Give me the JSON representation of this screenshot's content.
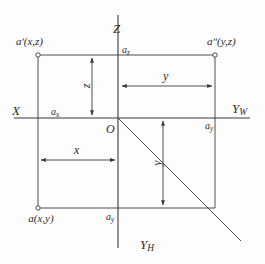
{
  "diagram": {
    "stroke_color": "#3a3a3a",
    "background_color": "#fdfdfd",
    "axes": [
      {
        "name": "z-axis-label",
        "label": "Z",
        "sub": ""
      },
      {
        "name": "x-axis-label",
        "label": "X",
        "sub": ""
      },
      {
        "name": "yw-axis-label",
        "label": "Y",
        "sub": "W"
      },
      {
        "name": "yh-axis-label",
        "label": "Y",
        "sub": "H"
      }
    ],
    "origin_label": "O",
    "points": [
      {
        "name": "point-a-prime",
        "label": "aʹ(x,z)"
      },
      {
        "name": "point-a-double-prime",
        "label": "aʺ(y,z)"
      },
      {
        "name": "point-a",
        "label": "a(x,y)"
      }
    ],
    "axis_intercepts": [
      {
        "name": "intercept-az",
        "label": "a",
        "sub": "z"
      },
      {
        "name": "intercept-ax",
        "label": "a",
        "sub": "x"
      },
      {
        "name": "intercept-ay-right",
        "label": "a",
        "sub": "y"
      },
      {
        "name": "intercept-ay-bottom",
        "label": "a",
        "sub": "y"
      }
    ],
    "dimensions": [
      {
        "name": "dimension-z",
        "label": "z",
        "orientation": "vertical"
      },
      {
        "name": "dimension-y-upper",
        "label": "y",
        "orientation": "horizontal"
      },
      {
        "name": "dimension-x",
        "label": "x",
        "orientation": "horizontal"
      },
      {
        "name": "dimension-y-lower",
        "label": "y",
        "orientation": "vertical"
      }
    ]
  }
}
